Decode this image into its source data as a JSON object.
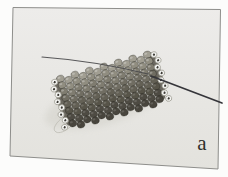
{
  "figure": {
    "label": "a"
  },
  "photo": {
    "page_bg": "#fcfcfb",
    "bg_top": "#edecea",
    "bg_bottom": "#e3e2dd",
    "border": "#8e8e8b",
    "shadow": "#d5d4cd",
    "thread": "#4a4a4c",
    "needle": "#35353a",
    "loop_thread": "#bdbcb4",
    "silver_bead": "#f3f3f0",
    "silver_stroke": "#9a998f",
    "bead_hole": "#3a3832",
    "bead_stroke": "rgba(25,25,18,0.38)",
    "end_face": "#5e5b52",
    "bead_rows": [
      "#a19e92",
      "#908d80",
      "#7f7c70",
      "#706d62",
      "#636055",
      "#575449",
      "#4e4b43",
      "#48453d"
    ],
    "tube": {
      "cx": 110,
      "cy": 89,
      "angle": -15.5,
      "cols": 13,
      "rows": 8,
      "bead_w": 7.5,
      "bead_h": 6.6
    }
  }
}
